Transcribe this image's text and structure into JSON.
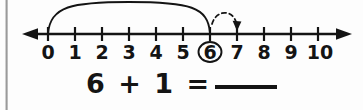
{
  "worksheet": {
    "type": "number-line-addition",
    "numberline": {
      "min_label": "0",
      "max_label": "10",
      "ticks": [
        "0",
        "1",
        "2",
        "3",
        "4",
        "5",
        "6",
        "7",
        "8",
        "9",
        "10"
      ],
      "circled_value": "6",
      "left_arrow": "left-arrowhead",
      "right_arrow": "right-arrowhead",
      "solid_arc": {
        "from": "0",
        "to": "6",
        "style": "solid",
        "meaning": "start-value-6"
      },
      "dashed_arc": {
        "from": "6",
        "to": "7",
        "style": "dashed",
        "arrowhead": "down",
        "meaning": "hop-forward-1"
      },
      "line_color": "#141414",
      "label_color": "#141414"
    },
    "equation": {
      "addend_1": "6",
      "operator": "+",
      "addend_2": "1",
      "equals": "=",
      "answer": "",
      "answer_placeholder": "blank-line",
      "text": "6 + 1 ="
    }
  }
}
